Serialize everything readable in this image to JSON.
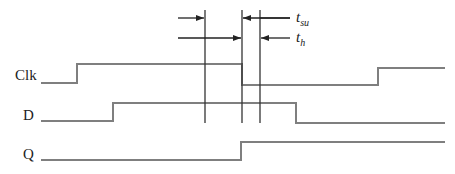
{
  "diagram": {
    "type": "timing-diagram",
    "signals": [
      {
        "name": "Clk",
        "label_y": 76
      },
      {
        "name": "D",
        "label_y": 116
      },
      {
        "name": "Q",
        "label_y": 155
      }
    ],
    "annotations": {
      "setup": {
        "symbol": "t",
        "subscript": "su"
      },
      "hold": {
        "symbol": "t",
        "subscript": "h"
      }
    },
    "colors": {
      "signal": "#7f7f7f",
      "marker": "#333333",
      "text": "#222222"
    }
  }
}
